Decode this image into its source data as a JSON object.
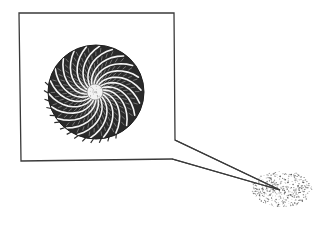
{
  "illustration": {
    "subject": "magnified microfossil (spiral foraminifera shell) with callout from a grain of sand/sediment",
    "colors": {
      "background": "#ffffff",
      "line": "#3a3a3a",
      "shell_dark": "#2a2a2a",
      "shell_light": "#f2f2f2",
      "speck": "#555555"
    },
    "callout_box": {
      "x1": 19,
      "y1": 13,
      "x2": 174,
      "y2": 161
    },
    "shell": {
      "cx": 95,
      "cy": 92,
      "r": 48,
      "chambers": 22
    },
    "pointer_target": {
      "x": 280,
      "y": 190
    },
    "speck_cloud": {
      "cx": 282,
      "cy": 189,
      "rx": 30,
      "ry": 18
    }
  }
}
